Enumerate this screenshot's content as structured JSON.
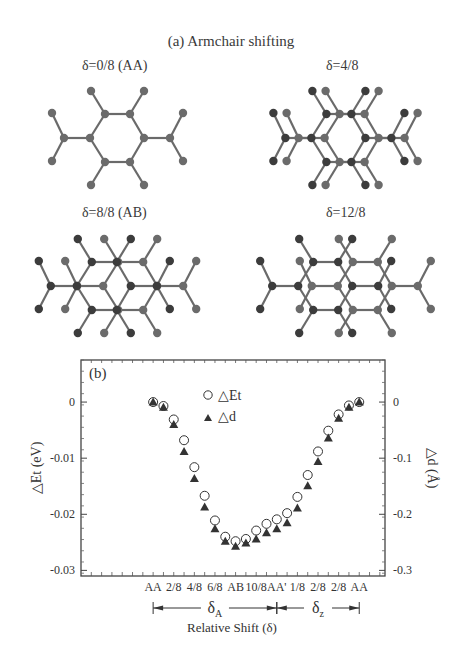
{
  "figure": {
    "title": "(a) Armchair shifting",
    "panels": [
      {
        "label": "δ=0/8 (AA)",
        "shift_eighths": 0
      },
      {
        "label": "δ=4/8",
        "shift_eighths": 4
      },
      {
        "label": "δ=8/8 (AB)",
        "shift_eighths": 8
      },
      {
        "label": "δ=12/8",
        "shift_eighths": 12
      }
    ],
    "colors": {
      "atom_light": "#6b6b6b",
      "atom_dark": "#3c3c3c",
      "bond": "#6a6a6a",
      "axis": "#444444",
      "marker": "#333333"
    }
  },
  "chart_data": {
    "type": "scatter",
    "panel_label": "(b)",
    "title": "",
    "xlabel": "Relative Shift (δ)",
    "ylabel_left": "△Et (eV)",
    "ylabel_right": "△d (Å)",
    "x": [
      0,
      1,
      2,
      3,
      4,
      5,
      6,
      7,
      8,
      9,
      10,
      11,
      12,
      13,
      14,
      15,
      16,
      17,
      18,
      19,
      20
    ],
    "x_tick_labels": [
      {
        "x": 0,
        "label": "AA"
      },
      {
        "x": 2,
        "label": "2/8"
      },
      {
        "x": 4,
        "label": "4/8"
      },
      {
        "x": 6,
        "label": "6/8"
      },
      {
        "x": 8,
        "label": "AB"
      },
      {
        "x": 10,
        "label": "10/8"
      },
      {
        "x": 12,
        "label": "AA'"
      },
      {
        "x": 14,
        "label": "1/8"
      },
      {
        "x": 16,
        "label": "2/8"
      },
      {
        "x": 18,
        "label": "2/8"
      },
      {
        "x": 20,
        "label": "AA"
      }
    ],
    "x_range": [
      -7,
      22.5
    ],
    "ylim_left": [
      -0.031,
      0.0075
    ],
    "yticks_left": [
      0,
      -0.01,
      -0.02,
      -0.03
    ],
    "ytick_labels_left": [
      "0",
      "-0.01",
      "-0.02",
      "-0.03"
    ],
    "ylim_right": [
      -0.31,
      0.075
    ],
    "yticks_right": [
      0,
      -0.1,
      -0.2,
      -0.3
    ],
    "ytick_labels_right": [
      "0",
      "-0.1",
      "-0.2",
      "-0.3"
    ],
    "series": [
      {
        "name": "△Et",
        "axis": "left",
        "marker": "open-circle",
        "values": [
          0,
          -0.0007,
          -0.0031,
          -0.0068,
          -0.0116,
          -0.0167,
          -0.0211,
          -0.024,
          -0.0248,
          -0.0244,
          -0.0229,
          -0.0217,
          -0.0209,
          -0.0198,
          -0.0169,
          -0.013,
          -0.0088,
          -0.0051,
          -0.0022,
          -0.0006,
          0
        ]
      },
      {
        "name": "△d",
        "axis": "right",
        "marker": "filled-triangle",
        "values": [
          0,
          -0.009,
          -0.04,
          -0.088,
          -0.136,
          -0.187,
          -0.226,
          -0.248,
          -0.257,
          -0.251,
          -0.244,
          -0.233,
          -0.226,
          -0.215,
          -0.189,
          -0.149,
          -0.106,
          -0.064,
          -0.029,
          -0.009,
          0
        ]
      }
    ],
    "legend": {
      "placement": "top-center",
      "entries": [
        {
          "marker": "open-circle",
          "label": "△Et"
        },
        {
          "marker": "filled-triangle",
          "label": "△d"
        }
      ]
    },
    "range_annotations": [
      {
        "label": "δA",
        "from": 0,
        "to": 12
      },
      {
        "label": "δz",
        "from": 12,
        "to": 20
      }
    ],
    "grid": false
  }
}
